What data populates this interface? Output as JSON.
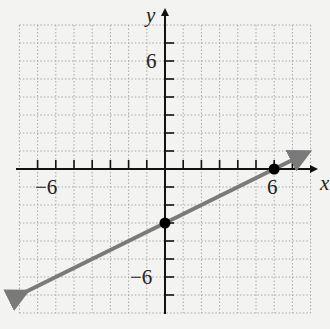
{
  "chart_data": {
    "type": "line",
    "title": "",
    "xlabel": "x",
    "ylabel": "y",
    "xlim": [
      -8,
      8
    ],
    "ylim": [
      -8,
      8
    ],
    "grid": true,
    "x_tick_labels": [
      {
        "value": -6,
        "label": "−6"
      },
      {
        "value": 6,
        "label": "6"
      }
    ],
    "y_tick_labels": [
      {
        "value": 6,
        "label": "6"
      },
      {
        "value": -6,
        "label": "−6"
      }
    ],
    "series": [
      {
        "name": "line",
        "equation": "y = 0.5x - 3",
        "slope": 0.5,
        "intercept": -3,
        "arrows": "both",
        "x_range": [
          -8,
          7.5
        ],
        "color": "#7a7a7a"
      }
    ],
    "points": [
      {
        "x": 0,
        "y": -3,
        "label": "y-intercept"
      },
      {
        "x": 6,
        "y": 0,
        "label": "x-intercept"
      }
    ]
  },
  "labels": {
    "x_axis": "x",
    "y_axis": "y",
    "x_neg6": "−6",
    "x_pos6": "6",
    "y_pos6": "6",
    "y_neg6": "−6"
  }
}
